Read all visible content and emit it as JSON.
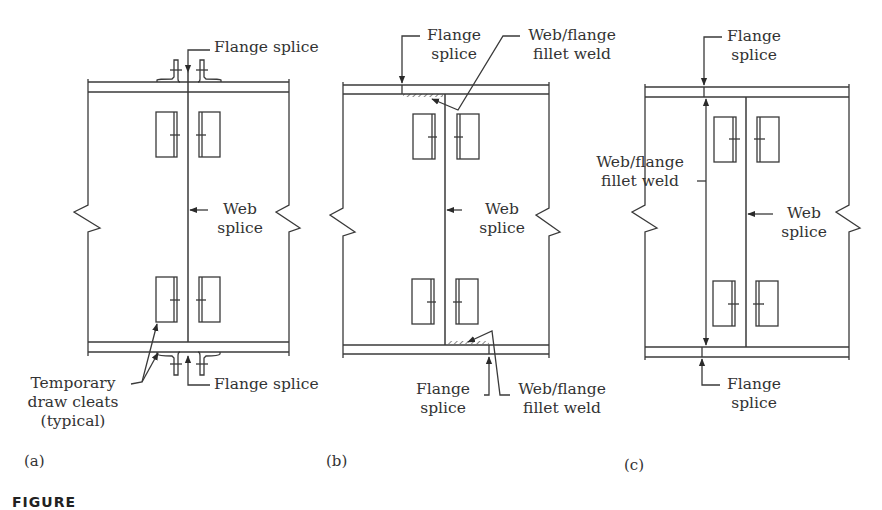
{
  "figure": {
    "caption_visible_fragment": "FIGURE",
    "line_color": "#3a3a3a",
    "text_color": "#333333",
    "background": "#ffffff"
  },
  "panels": [
    {
      "id": "a",
      "tag": "(a)",
      "labels": {
        "flange_splice_top": "Flange splice",
        "web_splice_line1": "Web",
        "web_splice_line2": "splice",
        "flange_splice_bottom": "Flange splice",
        "cleats_line1": "Temporary",
        "cleats_line2": "draw cleats",
        "cleats_line3": "(typical)"
      }
    },
    {
      "id": "b",
      "tag": "(b)",
      "labels": {
        "flange_splice_top_line1": "Flange",
        "flange_splice_top_line2": "splice",
        "fillet_weld_top_line1": "Web/flange",
        "fillet_weld_top_line2": "fillet weld",
        "web_splice_line1": "Web",
        "web_splice_line2": "splice",
        "flange_splice_bottom_line1": "Flange",
        "flange_splice_bottom_line2": "splice",
        "fillet_weld_bottom_line1": "Web/flange",
        "fillet_weld_bottom_line2": "fillet weld"
      }
    },
    {
      "id": "c",
      "tag": "(c)",
      "labels": {
        "flange_splice_top_line1": "Flange",
        "flange_splice_top_line2": "splice",
        "fillet_weld_line1": "Web/flange",
        "fillet_weld_line2": "fillet weld",
        "web_splice_line1": "Web",
        "web_splice_line2": "splice",
        "flange_splice_bottom_line1": "Flange",
        "flange_splice_bottom_line2": "splice"
      }
    }
  ]
}
